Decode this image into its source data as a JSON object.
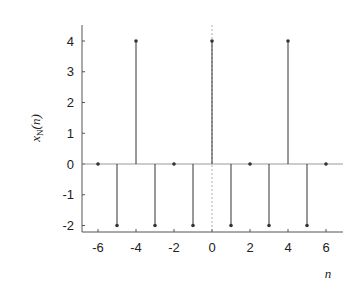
{
  "chart_data": {
    "type": "stem",
    "title": "",
    "xlabel": "n",
    "ylabel": "x_N(n)",
    "ylabel_display": {
      "base": "x",
      "subscript": "N",
      "arg": "(n)"
    },
    "x": [
      -6,
      -5,
      -4,
      -3,
      -2,
      -1,
      0,
      1,
      2,
      3,
      4,
      5,
      6
    ],
    "values": [
      0,
      -2,
      4,
      -2,
      0,
      -2,
      4,
      -2,
      0,
      -2,
      4,
      -2,
      0
    ],
    "xlim": [
      -6.8,
      6.8
    ],
    "ylim": [
      -2.5,
      4.5
    ],
    "xticks": [
      -6,
      -4,
      -2,
      0,
      2,
      4,
      6
    ],
    "xtick_labels": [
      "-6",
      "-4",
      "-2",
      "0",
      "2",
      "4",
      "6"
    ],
    "yticks": [
      4,
      3,
      2,
      1,
      0,
      -1,
      -2
    ],
    "ytick_labels": [
      "4",
      "3",
      "2",
      "1",
      "0",
      "-1",
      "-2"
    ],
    "grid": false,
    "reference_lines": {
      "horizontal_zero": true,
      "vertical_at_zero_dashed": true
    },
    "legend": null
  },
  "colors": {
    "stem": "#333333",
    "axis": "#555555",
    "ref": "#999999"
  }
}
